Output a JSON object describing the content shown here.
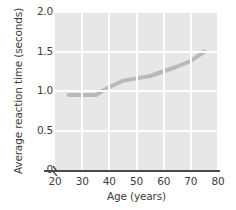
{
  "chart_data": {
    "type": "line",
    "title": "",
    "xlabel": "Age (years)",
    "ylabel": "Average reaction time (seconds)",
    "xlim": [
      20,
      80
    ],
    "ylim": [
      0,
      2.0
    ],
    "x_ticks": [
      20,
      30,
      40,
      50,
      60,
      70,
      80
    ],
    "x_tick_labels": [
      "20",
      "30",
      "40",
      "50",
      "60",
      "70",
      "80"
    ],
    "y_ticks": [
      0,
      0.5,
      1.0,
      1.5,
      2.0
    ],
    "y_tick_labels": [
      "0",
      "0.5",
      "1.0",
      "1.5",
      "2.0"
    ],
    "grid": true,
    "grid_color": "#fdfdfd",
    "plot_background": "#e7e7e7",
    "axis_break": "x-axis break between 0 and 20",
    "legend": null,
    "series": [
      {
        "name": "Average reaction time",
        "color": "#b9b9b9",
        "line_width": 4,
        "x": [
          25,
          30,
          35,
          40,
          45,
          50,
          55,
          60,
          65,
          70,
          75
        ],
        "y": [
          0.95,
          0.95,
          0.95,
          1.05,
          1.13,
          1.16,
          1.19,
          1.25,
          1.31,
          1.38,
          1.5
        ]
      }
    ]
  },
  "axis": {
    "spine_color": "#4a4a4a"
  }
}
